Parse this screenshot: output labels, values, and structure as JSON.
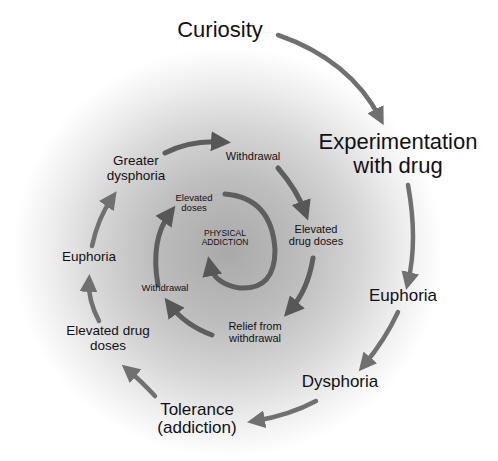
{
  "diagram": {
    "type": "spiral-cycle",
    "colors": {
      "outer_arrow": "#707070",
      "inner_arrow": "#575757",
      "text": "#111111",
      "background_center": "#a9a9a9",
      "background_edge": "#ffffff"
    },
    "outer_ring": {
      "curiosity": "Curiosity",
      "experimentation_line1": "Experimentation",
      "experimentation_line2": "with drug",
      "euphoria": "Euphoria",
      "dysphoria": "Dysphoria",
      "tolerance_line1": "Tolerance",
      "tolerance_line2": "(addiction)"
    },
    "middle_ring": {
      "elevated_drug_doses_line1": "Elevated drug",
      "elevated_drug_doses_line2": "doses",
      "euphoria": "Euphoria",
      "greater_dysphoria_line1": "Greater",
      "greater_dysphoria_line2": "dysphoria",
      "withdrawal": "Withdrawal",
      "elevated_line1": "Elevated",
      "elevated_line2": "drug doses"
    },
    "inner_ring": {
      "relief_line1": "Relief from",
      "relief_line2": "withdrawal",
      "withdrawal": "Withdrawal",
      "elevated_doses_line1": "Elevated",
      "elevated_doses_line2": "doses",
      "center_line1": "PHYSICAL",
      "center_line2": "ADDICTION"
    },
    "sequence": [
      "Curiosity",
      "Experimentation with drug",
      "Euphoria",
      "Dysphoria",
      "Tolerance (addiction)",
      "Elevated drug doses",
      "Euphoria",
      "Greater dysphoria",
      "Withdrawal",
      "Elevated drug doses",
      "Relief from withdrawal",
      "Withdrawal",
      "Elevated doses",
      "PHYSICAL ADDICTION"
    ]
  }
}
